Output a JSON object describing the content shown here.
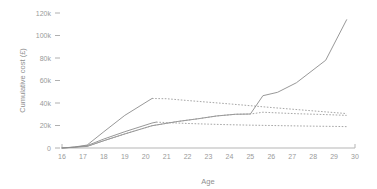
{
  "chart_data": {
    "type": "line",
    "title": "",
    "xlabel": "Age",
    "ylabel": "Cumulative cost (£)",
    "xlim": [
      16,
      30
    ],
    "ylim": [
      0,
      125000
    ],
    "grid": false,
    "legend": "none",
    "x_ticks": [
      "16",
      "17",
      "18",
      "19",
      "20",
      "21",
      "22",
      "23",
      "24",
      "25",
      "26",
      "27",
      "28",
      "29",
      "30"
    ],
    "x_tick_values": [
      16,
      17,
      18,
      19,
      20,
      21,
      22,
      23,
      24,
      25,
      26,
      27,
      28,
      29,
      30
    ],
    "y_ticks": [
      "0",
      "20k",
      "40k",
      "60k",
      "80k",
      "100k",
      "120k"
    ],
    "y_tick_values": [
      0,
      20000,
      40000,
      60000,
      80000,
      100000,
      120000
    ],
    "series": [
      {
        "name": "upper-estimate-observed",
        "style": "solid",
        "x": [
          16,
          16.6,
          17.2,
          18,
          19,
          20.3
        ],
        "values": [
          0,
          900,
          2600,
          14500,
          29000,
          44000
        ]
      },
      {
        "name": "upper-estimate-projected",
        "style": "dotted",
        "x": [
          20.3,
          21,
          22,
          23,
          24,
          25,
          26,
          27,
          28,
          29,
          29.6
        ],
        "values": [
          44000,
          43800,
          42200,
          40700,
          39200,
          37600,
          36000,
          34500,
          33000,
          31500,
          30600
        ]
      },
      {
        "name": "central-estimate-observed",
        "style": "solid",
        "x": [
          16,
          16.6,
          17.2,
          18,
          19,
          20.3,
          20.5
        ],
        "values": [
          0,
          700,
          2100,
          8000,
          14500,
          22200,
          23000
        ]
      },
      {
        "name": "central-estimate-projected",
        "style": "dotted",
        "x": [
          20.5,
          21,
          22,
          23,
          24,
          25,
          26,
          27,
          28,
          29,
          29.6
        ],
        "values": [
          23000,
          22600,
          21800,
          21200,
          20700,
          20300,
          20000,
          19700,
          19400,
          19200,
          19000
        ]
      },
      {
        "name": "cumulative-cost-main",
        "style": "solid",
        "x": [
          16,
          17.2,
          18,
          19,
          20.3,
          21.5,
          22.5,
          23.4,
          24.3,
          25,
          25.6,
          26.3,
          27.2,
          28.6,
          29.6
        ],
        "values": [
          0,
          1400,
          6500,
          12500,
          19800,
          23500,
          26000,
          28500,
          30000,
          30200,
          46500,
          49500,
          58000,
          78000,
          114000
        ]
      },
      {
        "name": "lower-band-projected",
        "style": "dotted",
        "x": [
          17.2,
          18,
          19,
          20.3,
          21.5,
          22.5,
          23.4,
          24.3,
          25,
          25.6,
          26.3,
          27.2,
          28.6,
          29.6
        ],
        "values": [
          1400,
          6500,
          12500,
          19800,
          23500,
          26000,
          28500,
          30000,
          30200,
          31800,
          31200,
          30500,
          29700,
          29000
        ]
      }
    ]
  }
}
